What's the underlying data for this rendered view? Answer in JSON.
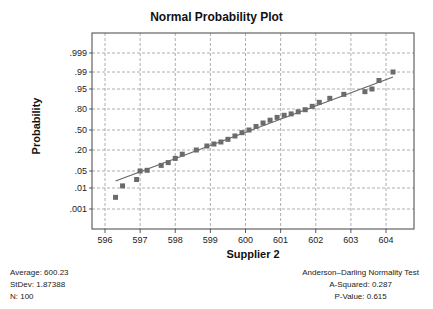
{
  "chart_data": {
    "type": "scatter",
    "title": "Normal Probability Plot",
    "xlabel": "Supplier 2",
    "ylabel": "Probability",
    "x_ticks": [
      "596",
      "597",
      "598",
      "599",
      "600",
      "601",
      "602",
      "603",
      "604"
    ],
    "y_ticks": [
      ".999",
      ".99",
      ".95",
      ".80",
      ".50",
      ".20",
      ".05",
      ".01",
      ".001"
    ],
    "xlim": [
      595.6,
      604.7
    ],
    "grid": true,
    "fit_line": {
      "x0": 596.3,
      "y0_label": ".02",
      "x1": 604.2,
      "y1_label": ".98"
    },
    "points": [
      {
        "x": 596.3,
        "p": 0.006
      },
      {
        "x": 596.5,
        "p": 0.015
      },
      {
        "x": 596.9,
        "p": 0.03
      },
      {
        "x": 597.0,
        "p": 0.05
      },
      {
        "x": 597.2,
        "p": 0.055
      },
      {
        "x": 597.6,
        "p": 0.09
      },
      {
        "x": 597.8,
        "p": 0.11
      },
      {
        "x": 598.0,
        "p": 0.14
      },
      {
        "x": 598.2,
        "p": 0.17
      },
      {
        "x": 598.6,
        "p": 0.2
      },
      {
        "x": 598.9,
        "p": 0.26
      },
      {
        "x": 599.1,
        "p": 0.29
      },
      {
        "x": 599.3,
        "p": 0.32
      },
      {
        "x": 599.5,
        "p": 0.36
      },
      {
        "x": 599.7,
        "p": 0.41
      },
      {
        "x": 599.9,
        "p": 0.46
      },
      {
        "x": 600.1,
        "p": 0.5
      },
      {
        "x": 600.3,
        "p": 0.55
      },
      {
        "x": 600.5,
        "p": 0.6
      },
      {
        "x": 600.7,
        "p": 0.64
      },
      {
        "x": 600.9,
        "p": 0.68
      },
      {
        "x": 601.1,
        "p": 0.71
      },
      {
        "x": 601.3,
        "p": 0.73
      },
      {
        "x": 601.5,
        "p": 0.76
      },
      {
        "x": 601.7,
        "p": 0.79
      },
      {
        "x": 601.9,
        "p": 0.82
      },
      {
        "x": 602.1,
        "p": 0.85
      },
      {
        "x": 602.4,
        "p": 0.88
      },
      {
        "x": 602.8,
        "p": 0.91
      },
      {
        "x": 603.4,
        "p": 0.93
      },
      {
        "x": 603.6,
        "p": 0.95
      },
      {
        "x": 603.8,
        "p": 0.97
      },
      {
        "x": 604.2,
        "p": 0.99
      }
    ]
  },
  "stats_left": {
    "average": "Average: 600.23",
    "stdev": "StDev: 1.87388",
    "n": "N: 100"
  },
  "stats_right": {
    "test_name": "Anderson–Darling Normality Test",
    "a_squared": "A-Squared: 0.287",
    "p_value": "P-Value: 0.615"
  }
}
